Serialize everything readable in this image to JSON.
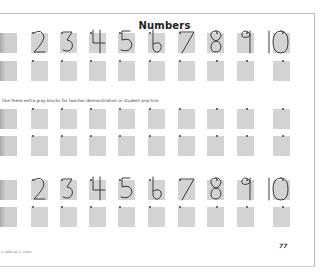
{
  "page": {
    "title": "Numbers",
    "instruction": "Use these extra gray blocks for teacher demonstration or student practice.",
    "copyright": "© 2003 Jan Z. Olsen",
    "page_number": "77"
  },
  "digits": [
    "2",
    "3",
    "4",
    "5",
    "6",
    "7",
    "8",
    "9",
    "10"
  ],
  "rows": [
    {
      "name": "model-row-top",
      "type": "model",
      "top": 33
    },
    {
      "name": "practice-row-1",
      "type": "practice",
      "top": 61
    },
    {
      "name": "practice-row-2",
      "type": "practice",
      "top": 109
    },
    {
      "name": "practice-row-3",
      "type": "practice",
      "top": 136
    },
    {
      "name": "model-row-bottom",
      "type": "model",
      "top": 180
    },
    {
      "name": "practice-row-4",
      "type": "practice",
      "top": 207
    }
  ],
  "colors": {
    "block": "#d3d3d3",
    "digit_stroke": "#3a3a3a",
    "text": "#222222"
  }
}
